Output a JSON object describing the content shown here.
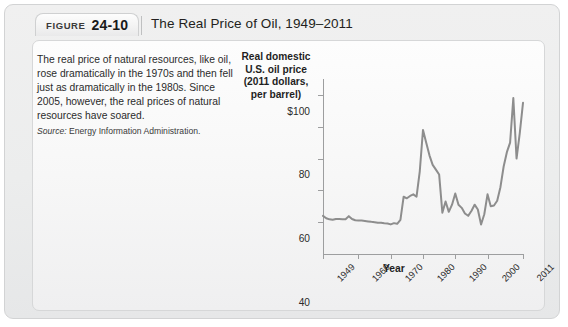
{
  "figure": {
    "label_word": "FIGURE",
    "number": "24-10",
    "title": "The Real Price of Oil, 1949–2011"
  },
  "caption": {
    "body": "The real price of natural resources, like oil, rose dramatically in the 1970s and then fell just as dramatically in the 1980s. Since 2005, however, the real prices of natural resources have soared.",
    "source_label": "Source:",
    "source_text": " Energy Information Administration."
  },
  "chart_data": {
    "type": "line",
    "title": "The Real Price of Oil, 1949–2011",
    "ylabel": "Real domestic U.S. oil price (2011 dollars, per barrel)",
    "xlabel": "Year",
    "ylim": [
      0,
      110
    ],
    "xlim": [
      1949,
      2011
    ],
    "grid": false,
    "legend": null,
    "line_color": "#8d8d8d",
    "y_ticks": [
      {
        "value": 100,
        "label": "$100"
      },
      {
        "value": 80,
        "label": "80"
      },
      {
        "value": 60,
        "label": "60"
      },
      {
        "value": 40,
        "label": "40"
      },
      {
        "value": 20,
        "label": "20"
      }
    ],
    "x_ticks": [
      {
        "value": 1949,
        "label": "1949"
      },
      {
        "value": 1960,
        "label": "1960"
      },
      {
        "value": 1970,
        "label": "1970"
      },
      {
        "value": 1980,
        "label": "1980"
      },
      {
        "value": 1990,
        "label": "1990"
      },
      {
        "value": 2000,
        "label": "2000"
      },
      {
        "value": 2011,
        "label": "2011"
      }
    ],
    "x": [
      1949,
      1950,
      1951,
      1952,
      1953,
      1954,
      1955,
      1956,
      1957,
      1958,
      1959,
      1960,
      1961,
      1962,
      1963,
      1964,
      1965,
      1966,
      1967,
      1968,
      1969,
      1970,
      1971,
      1972,
      1973,
      1974,
      1975,
      1976,
      1977,
      1978,
      1979,
      1980,
      1981,
      1982,
      1983,
      1984,
      1985,
      1986,
      1987,
      1988,
      1989,
      1990,
      1991,
      1992,
      1993,
      1994,
      1995,
      1996,
      1997,
      1998,
      1999,
      2000,
      2001,
      2002,
      2003,
      2004,
      2005,
      2006,
      2007,
      2008,
      2009,
      2010,
      2011
    ],
    "y": [
      24.0,
      22.5,
      21.8,
      21.5,
      22.0,
      22.0,
      21.8,
      21.8,
      23.8,
      22.0,
      21.2,
      21.0,
      21.0,
      20.8,
      20.5,
      20.2,
      20.0,
      19.6,
      19.6,
      19.3,
      19.2,
      18.6,
      19.4,
      19.0,
      21.5,
      36.0,
      35.0,
      36.5,
      37.5,
      36.0,
      52.0,
      78.0,
      70.0,
      62.0,
      56.0,
      53.0,
      50.0,
      26.0,
      33.0,
      26.5,
      31.0,
      38.0,
      31.0,
      29.0,
      25.5,
      24.0,
      27.0,
      31.0,
      28.0,
      18.5,
      25.0,
      37.5,
      30.0,
      30.5,
      33.5,
      42.0,
      55.0,
      64.0,
      70.0,
      98.0,
      60.0,
      76.0,
      95.0
    ]
  }
}
